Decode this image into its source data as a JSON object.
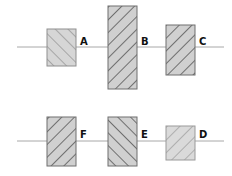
{
  "diagram": {
    "rows": [
      {
        "line_y": 47,
        "boxes": [
          {
            "label": "A",
            "x": 47,
            "y": 29,
            "w": 29,
            "h": 37,
            "hatch": "backslash",
            "stroke": "#8f8f8f",
            "fill": "#d6d6d6"
          },
          {
            "label": "B",
            "x": 108,
            "y": 6,
            "w": 29,
            "h": 83,
            "hatch": "slash",
            "stroke": "#6f6f6f",
            "fill": "#d0d0d0"
          },
          {
            "label": "C",
            "x": 166,
            "y": 25,
            "w": 29,
            "h": 50,
            "hatch": "slash",
            "stroke": "#6f6f6f",
            "fill": "#d0d0d0"
          }
        ]
      },
      {
        "line_y": 141,
        "boxes": [
          {
            "label": "F",
            "x": 47,
            "y": 117,
            "w": 29,
            "h": 49,
            "hatch": "slash",
            "stroke": "#6f6f6f",
            "fill": "#d0d0d0"
          },
          {
            "label": "E",
            "x": 108,
            "y": 117,
            "w": 29,
            "h": 49,
            "hatch": "backslash",
            "stroke": "#6f6f6f",
            "fill": "#d0d0d0"
          },
          {
            "label": "D",
            "x": 166,
            "y": 126,
            "w": 29,
            "h": 34,
            "hatch": "slash",
            "stroke": "#9a9a9a",
            "fill": "#dadada"
          }
        ]
      }
    ],
    "labels": {
      "A": "A",
      "B": "B",
      "C": "C",
      "D": "D",
      "E": "E",
      "F": "F"
    },
    "line_color": "#a8a8a8"
  }
}
